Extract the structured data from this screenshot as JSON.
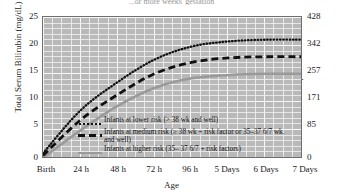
{
  "title": "...or more weeks' gestation",
  "axes": {
    "y_left_label": "Total Serum Bilirubin (mg/dL)",
    "y_right_label": "µmol/L",
    "x_label": "Age",
    "y_left_ticks": [
      "0",
      "5",
      "10",
      "15",
      "20",
      "25"
    ],
    "y_right_ticks": [
      "0",
      "85",
      "171",
      "257",
      "342",
      "428"
    ],
    "x_ticks": [
      "Birth",
      "24 h",
      "48 h",
      "72 h",
      "96 h",
      "5 Days",
      "6 Days",
      "7 Days"
    ]
  },
  "legend": {
    "items": [
      {
        "marker": "dotted-line-icon",
        "label": "Infants at lower risk (> 38 wk and well)"
      },
      {
        "marker": "dashed-line-icon",
        "label": "Infants at medium risk (≥ 38 wk + risk factor  or 35–37 6/7 wk. and well)"
      },
      {
        "marker": "solid-gray-line-icon",
        "label": "Infants at higher risk (35– 37 6/7 + risk factors)"
      }
    ]
  },
  "chart_data": {
    "type": "line",
    "title": "...or more weeks' gestation",
    "xlabel": "Age",
    "ylabel": "Total Serum Bilirubin (mg/dL)",
    "ylabel_secondary": "µmol/L",
    "x": [
      "Birth",
      "24 h",
      "48 h",
      "72 h",
      "96 h",
      "5 Days",
      "6 Days",
      "7 Days"
    ],
    "xlim": [
      0,
      7
    ],
    "ylim": [
      0,
      25
    ],
    "ylim_secondary": [
      0,
      428
    ],
    "grid": true,
    "legend_position": "inside-bottom-left",
    "series": [
      {
        "name": "Infants at lower risk (> 38 wk and well)",
        "style": "dotted",
        "color": "#111111",
        "values": [
          1.0,
          8.5,
          13.5,
          17.5,
          19.8,
          20.7,
          21.0,
          21.0
        ]
      },
      {
        "name": "Infants at medium risk (≥ 38 wk + risk factor  or 35–37 6/7 wk. and well)",
        "style": "dashed",
        "color": "#111111",
        "values": [
          0.6,
          6.8,
          11.3,
          15.0,
          17.0,
          17.8,
          18.0,
          18.0
        ]
      },
      {
        "name": "Infants at higher risk (35– 37 6/7 + risk factors)",
        "style": "solid",
        "color": "#9a9a9a",
        "values": [
          0.2,
          5.0,
          9.3,
          12.5,
          14.2,
          14.8,
          15.0,
          15.0
        ]
      }
    ]
  }
}
